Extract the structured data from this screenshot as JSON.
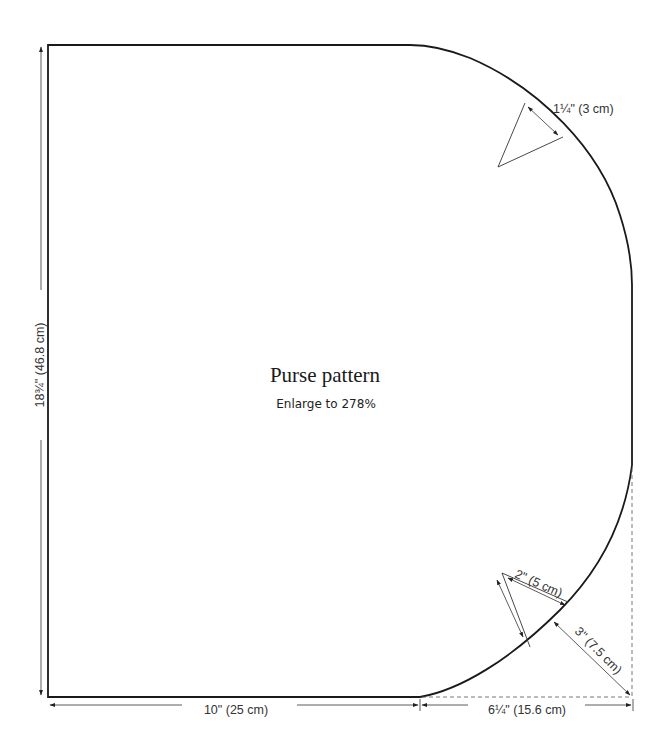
{
  "pattern": {
    "title": "Purse pattern",
    "subtitle": "Enlarge to 278%"
  },
  "dimensions": {
    "height": "18¾\" (46.8 cm)",
    "bottom_straight": "10\" (25 cm)",
    "bottom_curve": "6¼\" (15.6 cm)",
    "top_notch": "1¼\" (3 cm)",
    "bottom_notch": "2\" (5 cm)",
    "corner_offset": "3\" (7.5 cm)"
  },
  "colors": {
    "outline": "#1a1a1a",
    "dimension_lines": "#333333",
    "background": "#ffffff"
  }
}
